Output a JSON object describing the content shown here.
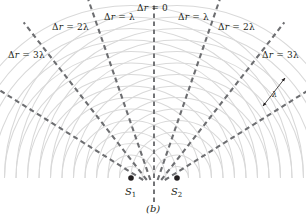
{
  "figure": {
    "caption": "(b)",
    "colors": {
      "wavefront": "#d9d9d9",
      "dashed_line": "#6d6e71",
      "source_dot": "#231f20",
      "text": "#231f20",
      "background": "#ffffff"
    }
  },
  "sources": [
    {
      "id": "S1",
      "label": "S",
      "sub": "1",
      "x": 131,
      "y": 178
    },
    {
      "id": "S2",
      "label": "S",
      "sub": "2",
      "x": 177,
      "y": 178
    }
  ],
  "antinodal_lines": [
    {
      "order": -3,
      "label_delta": "Δ",
      "label_r": "r",
      "label_eq": " = ",
      "label_val": "3λ",
      "label_x": 8,
      "label_y": 50,
      "angle_deg": -58
    },
    {
      "order": -2,
      "label_delta": "Δ",
      "label_r": "r",
      "label_eq": " = ",
      "label_val": "2λ",
      "label_x": 52,
      "label_y": 22,
      "angle_deg": -38
    },
    {
      "order": -1,
      "label_delta": "Δ",
      "label_r": "r",
      "label_eq": " = ",
      "label_val": "λ",
      "label_x": 104,
      "label_y": 12,
      "angle_deg": -19
    },
    {
      "order": 0,
      "label_delta": "Δ",
      "label_r": "r",
      "label_eq": " = ",
      "label_val": "0",
      "label_x": 137,
      "label_y": 3,
      "angle_deg": 0
    },
    {
      "order": 1,
      "label_delta": "Δ",
      "label_r": "r",
      "label_eq": " = ",
      "label_val": "λ",
      "label_x": 178,
      "label_y": 12,
      "angle_deg": 19
    },
    {
      "order": 2,
      "label_delta": "Δ",
      "label_r": "r",
      "label_eq": " = ",
      "label_val": "2λ",
      "label_x": 218,
      "label_y": 22,
      "angle_deg": 38
    },
    {
      "order": 3,
      "label_delta": "Δ",
      "label_r": "r",
      "label_eq": " = ",
      "label_val": "3λ",
      "label_x": 262,
      "label_y": 50,
      "angle_deg": 58
    }
  ],
  "wavelength_annotation": {
    "symbol": "λ",
    "x": 272,
    "y": 90
  },
  "wavefronts": {
    "spacing_px": 11.5,
    "count_per_source": 15,
    "description": "concentric circular crests emanating from each source"
  }
}
